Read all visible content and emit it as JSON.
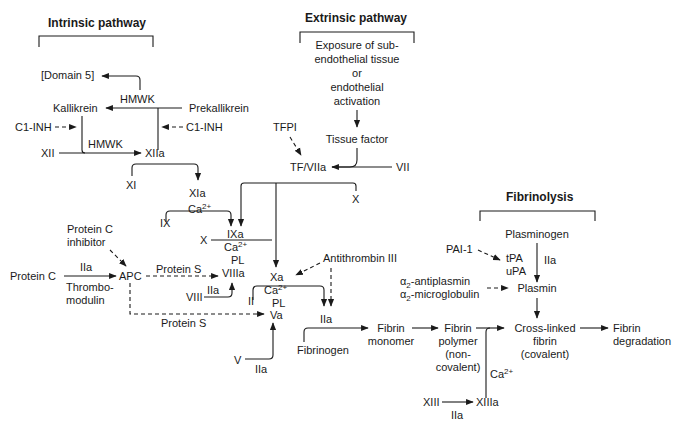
{
  "headers": {
    "intrinsic": "Intrinsic pathway",
    "extrinsic": "Extrinsic pathway",
    "fibrinolysis": "Fibrinolysis"
  },
  "intrinsic": {
    "domain5": "[Domain 5]",
    "hmwk_top": "HMWK",
    "kallikrein": "Kallikrein",
    "prekallikrein": "Prekallikrein",
    "c1inh_left": "C1-INH",
    "c1inh_right": "C1-INH",
    "hmwk_mid": "HMWK",
    "xii": "XII",
    "xiia": "XIIa",
    "xi": "XI",
    "xia": "XIa",
    "ix": "IX",
    "ca_ix": "Ca",
    "ca_ix_sup": "2+",
    "ixa": "IXa",
    "x_left": "X",
    "ca_ixa": "Ca",
    "ca_ixa_sup": "2+",
    "pl_ixa": "PL",
    "viiia": "VIIIa",
    "viii": "VIII",
    "iia_viii": "IIa"
  },
  "extrinsic": {
    "exposure": [
      "Exposure of sub-",
      "endothelial tissue",
      "or",
      "endothelial",
      "activation"
    ],
    "tissue_factor": "Tissue factor",
    "tfpi": "TFPI",
    "tf_viia": "TF/VIIa",
    "vii": "VII",
    "x_right": "X"
  },
  "protein_c": {
    "inhibitor": [
      "Protein C",
      "inhibitor"
    ],
    "protein_c": "Protein C",
    "iia": "IIa",
    "thrombomodulin": [
      "Thrombo-",
      "modulin"
    ],
    "apc": "APC",
    "protein_s_top": "Protein S",
    "protein_s_bottom": "Protein S"
  },
  "common": {
    "xa": "Xa",
    "ca_xa": "Ca",
    "ca_xa_sup": "2+",
    "pl_xa": "PL",
    "va": "Va",
    "ii": "II",
    "antithrombin": "Antithrombin III",
    "iia": "IIa",
    "v": "V",
    "iia_v": "IIa",
    "fibrinogen": "Fibrinogen",
    "fibrin_monomer": [
      "Fibrin",
      "monomer"
    ],
    "fibrin_polymer": [
      "Fibrin",
      "polymer",
      "(non-",
      "covalent)"
    ],
    "ca_xiii": "Ca",
    "ca_xiii_sup": "2+",
    "xiii": "XIII",
    "xiiia": "XIIIa",
    "iia_xiii": "IIa",
    "crosslinked": [
      "Cross-linked",
      "fibrin",
      "(covalent)"
    ],
    "degradation": [
      "Fibrin",
      "degradation"
    ]
  },
  "fibrinolysis": {
    "pai1": "PAI-1",
    "plasminogen": "Plasminogen",
    "tpa": "tPA",
    "upa": "uPA",
    "iia": "IIa",
    "alpha": "α",
    "sub2": "2",
    "antiplasmin": "-antiplasmin",
    "microglobulin": "-microglobulin",
    "plasmin": "Plasmin"
  }
}
